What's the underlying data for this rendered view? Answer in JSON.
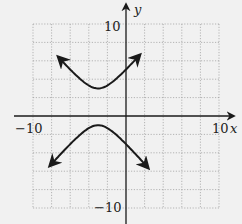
{
  "chart_data": {
    "type": "line",
    "title": "",
    "xlabel": "x",
    "ylabel": "y",
    "xlim": [
      -10,
      10
    ],
    "ylim": [
      -10,
      10
    ],
    "grid": true,
    "grid_step": 2,
    "tick_labels": {
      "x": [
        "-10",
        "10"
      ],
      "y": [
        "10",
        "-10"
      ]
    },
    "series": [
      {
        "name": "upper branch",
        "x": [
          -7.3,
          -6,
          -5,
          -4,
          -3,
          -2,
          -1,
          0,
          1.5
        ],
        "y": [
          9.9,
          6.5,
          4.6,
          3.3,
          3.0,
          3.3,
          4.6,
          6.5,
          9.9
        ]
      },
      {
        "name": "lower branch",
        "x": [
          -8.2,
          -6,
          -5,
          -4,
          -3,
          -2,
          -1,
          0,
          2.4
        ],
        "y": [
          -9.7,
          -4.5,
          -2.6,
          -1.3,
          -1.0,
          -1.3,
          -2.6,
          -4.5,
          -9.7
        ]
      }
    ]
  },
  "labels": {
    "x_axis": "x",
    "y_axis": "y",
    "x_min": "−10",
    "x_max": "10",
    "y_max": "10",
    "y_min": "−10"
  }
}
